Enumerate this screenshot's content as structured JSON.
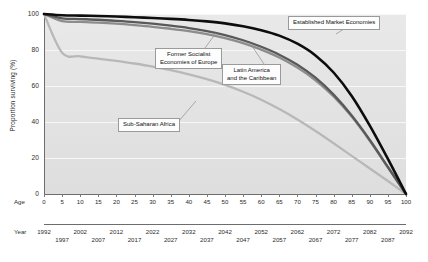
{
  "axes": {
    "y_label": "Proportion surviving (%)",
    "y_ticks": [
      "100",
      "80",
      "60",
      "40",
      "20",
      "0"
    ],
    "age_row_label": "Age",
    "age_ticks": [
      "0",
      "5",
      "10",
      "15",
      "20",
      "25",
      "30",
      "35",
      "40",
      "45",
      "50",
      "55",
      "60",
      "65",
      "70",
      "75",
      "80",
      "85",
      "90",
      "95",
      "100"
    ],
    "year_row_label": "Year",
    "year_ticks_top": [
      "1992",
      "2002",
      "2012",
      "2022",
      "2032",
      "2042",
      "2052",
      "2062",
      "2072",
      "2082",
      "2092"
    ],
    "year_ticks_bottom": [
      "1997",
      "2007",
      "2017",
      "2027",
      "2037",
      "2047",
      "2057",
      "2067",
      "2077",
      "2087"
    ]
  },
  "callouts": {
    "established": "Established Market Economies",
    "socialist_line1": "Former Socialist",
    "socialist_line2": "Economies of Europe",
    "latin_line1": "Latin America",
    "latin_line2": "and the Caribbean",
    "africa": "Sub-Saharan Africa"
  },
  "chart_data": {
    "type": "line",
    "title": "",
    "xlabel": "Age",
    "ylabel": "Proportion surviving (%)",
    "xlim": [
      0,
      100
    ],
    "ylim": [
      0,
      100
    ],
    "grid": true,
    "legend": "inline-callouts",
    "x": [
      0,
      5,
      10,
      15,
      20,
      25,
      30,
      35,
      40,
      45,
      50,
      55,
      60,
      65,
      70,
      75,
      80,
      85,
      90,
      95,
      100
    ],
    "series": [
      {
        "name": "Established Market Economies",
        "color": "#0d0d0d",
        "width": 2.6,
        "values": [
          100,
          99.3,
          99.1,
          98.9,
          98.6,
          98.2,
          97.8,
          97.3,
          96.7,
          95.9,
          94.8,
          93.2,
          91.0,
          88.0,
          83.5,
          77.0,
          67.5,
          54.5,
          38.0,
          19.5,
          0
        ]
      },
      {
        "name": "Former Socialist Economies of Europe",
        "color": "#595959",
        "width": 2.3,
        "values": [
          100,
          97.6,
          97.2,
          96.8,
          96.2,
          95.5,
          94.6,
          93.5,
          92.2,
          90.5,
          88.3,
          85.4,
          81.8,
          77.4,
          71.8,
          64.6,
          55.2,
          43.6,
          30.0,
          15.0,
          0
        ]
      },
      {
        "name": "Latin America and the Caribbean",
        "color": "#8c8c8c",
        "width": 2.3,
        "values": [
          100,
          96.0,
          95.6,
          95.2,
          94.6,
          93.8,
          92.9,
          91.8,
          90.5,
          88.8,
          86.6,
          83.8,
          80.2,
          75.8,
          70.2,
          63.2,
          54.2,
          43.0,
          29.6,
          14.8,
          0
        ]
      },
      {
        "name": "Sub-Saharan Africa",
        "color": "#b8b8b8",
        "width": 2.3,
        "values": [
          100,
          78.5,
          76.5,
          75.2,
          74.0,
          72.5,
          70.8,
          68.8,
          66.5,
          63.8,
          60.6,
          56.8,
          52.4,
          47.2,
          41.4,
          35.0,
          28.2,
          21.2,
          14.2,
          7.2,
          0
        ]
      }
    ]
  }
}
